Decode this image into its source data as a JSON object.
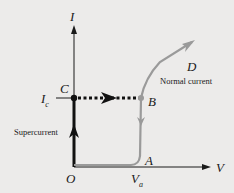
{
  "diagram": {
    "title": "",
    "axes": {
      "y_label": "I",
      "x_label": "V",
      "origin_label": "O"
    },
    "points": {
      "C": "C",
      "B": "B",
      "D": "D",
      "A": "A"
    },
    "critical_current": {
      "symbol": "I",
      "sub": "c"
    },
    "voltage_marker": {
      "symbol": "V",
      "sub": "a"
    },
    "annotations": {
      "supercurrent": "Supercurrent",
      "normal_current": "Normal current"
    },
    "colors": {
      "background": "#ecebea",
      "axis": "#1a1a1a",
      "supercurrent_path": "#111111",
      "normal_path": "#9a9a9a"
    }
  }
}
